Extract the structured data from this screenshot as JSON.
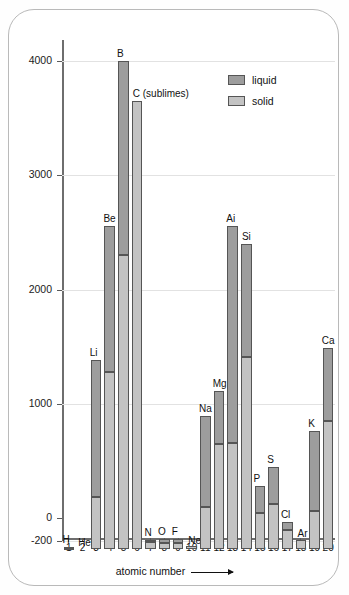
{
  "chart_data": {
    "type": "bar",
    "title": "",
    "xlabel": "atomic number",
    "ylabel": "temperature/°C",
    "ylim": [
      -270,
      4200
    ],
    "xlim": [
      0.5,
      20.5
    ],
    "grid": true,
    "legend_position": "top-right",
    "y_ticks": [
      -200,
      0,
      1000,
      2000,
      3000,
      4000
    ],
    "y_tick_labels": [
      "-200",
      "0",
      "1000",
      "2000",
      "3000",
      "4000"
    ],
    "x_ticks": [
      1,
      2,
      3,
      4,
      5,
      6,
      7,
      8,
      9,
      10,
      11,
      12,
      13,
      14,
      15,
      16,
      17,
      18,
      19,
      20
    ],
    "x_tick_labels": [
      "1",
      "2",
      "3",
      "4",
      "5",
      "6",
      "7",
      "8",
      "9",
      "10",
      "11",
      "12",
      "13",
      "14",
      "15",
      "16",
      "17",
      "18",
      "19",
      "20"
    ],
    "series": [
      {
        "name": "solid",
        "color": "#c3c3c3",
        "description": "bar spans from baseline up to the melting point"
      },
      {
        "name": "liquid",
        "color": "#9d9d9d",
        "description": "bar spans from the melting point up to the boiling point"
      }
    ],
    "categories": [
      "H",
      "He",
      "Li",
      "Be",
      "B",
      "C",
      "N",
      "O",
      "F",
      "Ne",
      "Na",
      "Mg",
      "Ai",
      "Si",
      "P",
      "S",
      "Cl",
      "Ar",
      "K",
      "Ca"
    ],
    "bars": [
      {
        "atomic_number": 1,
        "label": "H",
        "melting_point": -259,
        "boiling_point": -253
      },
      {
        "atomic_number": 2,
        "label": "He",
        "melting_point": -272,
        "boiling_point": -269
      },
      {
        "atomic_number": 3,
        "label": "Li",
        "melting_point": 180,
        "boiling_point": 1380
      },
      {
        "atomic_number": 4,
        "label": "Be",
        "melting_point": 1280,
        "boiling_point": 2560
      },
      {
        "atomic_number": 5,
        "label": "B",
        "melting_point": 2300,
        "boiling_point": 4000
      },
      {
        "atomic_number": 6,
        "label": "C (sublimes)",
        "melting_point": 3650,
        "boiling_point": 3650
      },
      {
        "atomic_number": 7,
        "label": "N",
        "melting_point": -210,
        "boiling_point": -196
      },
      {
        "atomic_number": 8,
        "label": "O",
        "melting_point": -218,
        "boiling_point": -183
      },
      {
        "atomic_number": 9,
        "label": "F",
        "melting_point": -220,
        "boiling_point": -188
      },
      {
        "atomic_number": 10,
        "label": "Ne",
        "melting_point": -249,
        "boiling_point": -246
      },
      {
        "atomic_number": 11,
        "label": "Na",
        "melting_point": 98,
        "boiling_point": 890
      },
      {
        "atomic_number": 12,
        "label": "Mg",
        "melting_point": 650,
        "boiling_point": 1110
      },
      {
        "atomic_number": 13,
        "label": "Ai",
        "melting_point": 660,
        "boiling_point": 2560
      },
      {
        "atomic_number": 14,
        "label": "Si",
        "melting_point": 1410,
        "boiling_point": 2400
      },
      {
        "atomic_number": 15,
        "label": "P",
        "melting_point": 44,
        "boiling_point": 280
      },
      {
        "atomic_number": 16,
        "label": "S",
        "melting_point": 119,
        "boiling_point": 445
      },
      {
        "atomic_number": 17,
        "label": "Cl",
        "melting_point": -101,
        "boiling_point": -35
      },
      {
        "atomic_number": 18,
        "label": "Ar",
        "melting_point": -189,
        "boiling_point": -186
      },
      {
        "atomic_number": 19,
        "label": "K",
        "melting_point": 64,
        "boiling_point": 760
      },
      {
        "atomic_number": 20,
        "label": "Ca",
        "melting_point": 850,
        "boiling_point": 1490
      }
    ]
  },
  "legend": {
    "items": [
      {
        "label": "liquid",
        "color": "#9d9d9d"
      },
      {
        "label": "solid",
        "color": "#c3c3c3"
      }
    ]
  },
  "axes": {
    "y_title": "temperature/°C",
    "x_title": "atomic number"
  }
}
